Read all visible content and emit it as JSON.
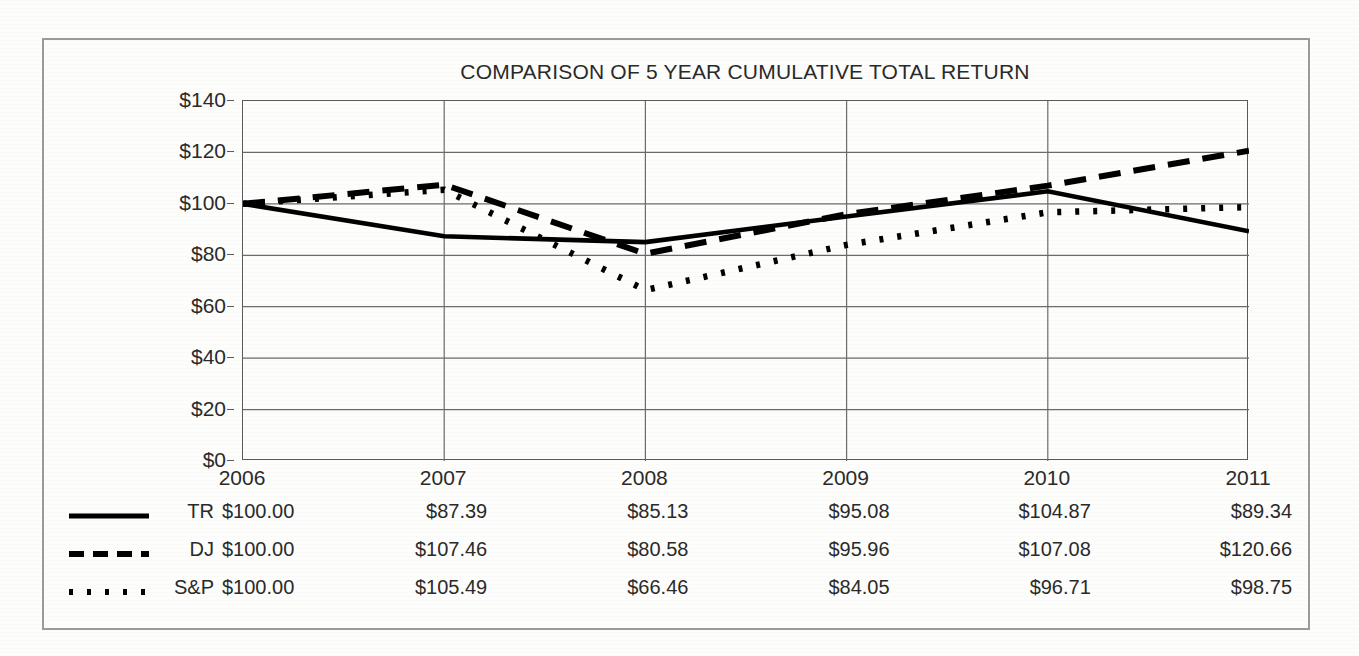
{
  "chart_data": {
    "type": "line",
    "title": "COMPARISON OF 5 YEAR CUMULATIVE TOTAL RETURN",
    "xlabel": "",
    "ylabel": "",
    "ylim": [
      0,
      140
    ],
    "ytick_step": 20,
    "grid": true,
    "legend_position": "bottom-left",
    "categories": [
      "2006",
      "2007",
      "2008",
      "2009",
      "2010",
      "2011"
    ],
    "ytick_labels": [
      "$140",
      "$120",
      "$100",
      "$80",
      "$60",
      "$40",
      "$20",
      "$0"
    ],
    "ytick_values": [
      140,
      120,
      100,
      80,
      60,
      40,
      20,
      0
    ],
    "series": [
      {
        "name": "TR",
        "style": "solid",
        "color": "#000000",
        "values": [
          100.0,
          87.39,
          85.13,
          95.08,
          104.87,
          89.34
        ],
        "labels": [
          "$100.00",
          "$87.39",
          "$85.13",
          "$95.08",
          "$104.87",
          "$89.34"
        ]
      },
      {
        "name": "DJ",
        "style": "dashed",
        "color": "#000000",
        "values": [
          100.0,
          107.46,
          80.58,
          95.96,
          107.08,
          120.66
        ],
        "labels": [
          "$100.00",
          "$107.46",
          "$80.58",
          "$95.96",
          "$107.08",
          "$120.66"
        ]
      },
      {
        "name": "S&P",
        "style": "dotted",
        "color": "#000000",
        "values": [
          100.0,
          105.49,
          66.46,
          84.05,
          96.71,
          98.75
        ],
        "labels": [
          "$100.00",
          "$105.49",
          "$66.46",
          "$84.05",
          "$96.71",
          "$98.75"
        ]
      }
    ]
  },
  "colors": {
    "ink": "#000000",
    "axis": "#5a5a5a",
    "grid": "#6b6b6b",
    "frame": "#9a9a9a",
    "page": "#fdfdfc"
  }
}
